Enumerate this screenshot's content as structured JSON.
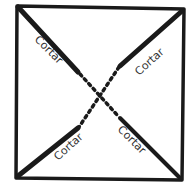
{
  "diagram": {
    "title": "",
    "colors": {
      "stroke": "#1a1a1a",
      "text": "#333333",
      "background": "#ffffff"
    },
    "labels": [
      {
        "id": "top-left",
        "text": "Cortar"
      },
      {
        "id": "top-right",
        "text": "Cortar"
      },
      {
        "id": "bottom-left",
        "text": "Cortar"
      },
      {
        "id": "bottom-right",
        "text": "Cortar"
      }
    ]
  }
}
